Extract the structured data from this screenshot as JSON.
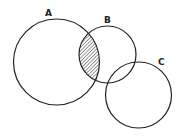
{
  "diagram": {
    "type": "venn",
    "sets": [
      {
        "label": "A",
        "cx": 56.5,
        "cy": 62,
        "r": 43
      },
      {
        "label": "B",
        "cx": 107.5,
        "cy": 54.5,
        "r": 28.5
      },
      {
        "label": "C",
        "cx": 138.5,
        "cy": 95,
        "r": 33
      }
    ],
    "shaded_region": "A ∩ B",
    "labels": {
      "a": "A",
      "b": "B",
      "c": "C"
    },
    "colors": {
      "stroke": "#222222",
      "hatch": "#333333",
      "background": "#ffffff"
    }
  }
}
